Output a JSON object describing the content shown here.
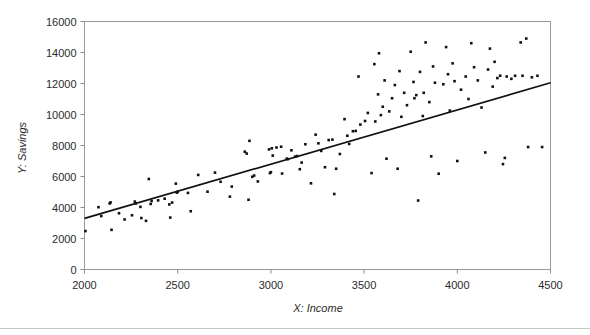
{
  "chart_data": {
    "type": "scatter",
    "title": "",
    "xlabel": "X: Income",
    "ylabel": "Y: Savings",
    "xlim": [
      2000,
      4500
    ],
    "ylim": [
      0,
      16000
    ],
    "xticks": [
      2000,
      2500,
      3000,
      3500,
      4000,
      4500
    ],
    "yticks": [
      0,
      2000,
      4000,
      6000,
      8000,
      10000,
      12000,
      14000,
      16000
    ],
    "xtick_labels": [
      "2000",
      "2500",
      "3000",
      "3500",
      "4000",
      "4500"
    ],
    "ytick_labels": [
      "0",
      "2000",
      "4000",
      "6000",
      "8000",
      "10000",
      "12000",
      "14000",
      "16000"
    ],
    "grid": false,
    "legend": null,
    "marker": "square",
    "marker_color": "#111111",
    "trendline": {
      "type": "linear",
      "x": [
        2000,
        4500
      ],
      "y": [
        3300,
        12050
      ],
      "slope": 3.5,
      "intercept": -3700,
      "color": "#111111"
    },
    "series": [
      {
        "name": "Savings vs Income",
        "points": [
          [
            2005,
            2480
          ],
          [
            2075,
            4020
          ],
          [
            2090,
            3450
          ],
          [
            2135,
            4260
          ],
          [
            2140,
            4330
          ],
          [
            2145,
            2560
          ],
          [
            2185,
            3630
          ],
          [
            2215,
            3230
          ],
          [
            2255,
            3500
          ],
          [
            2270,
            4380
          ],
          [
            2275,
            4260
          ],
          [
            2300,
            4040
          ],
          [
            2305,
            3320
          ],
          [
            2330,
            3140
          ],
          [
            2345,
            5840
          ],
          [
            2355,
            4230
          ],
          [
            2360,
            4420
          ],
          [
            2395,
            4460
          ],
          [
            2430,
            4570
          ],
          [
            2455,
            4200
          ],
          [
            2460,
            3350
          ],
          [
            2470,
            4320
          ],
          [
            2490,
            5540
          ],
          [
            2495,
            4960
          ],
          [
            2500,
            5010
          ],
          [
            2555,
            4940
          ],
          [
            2570,
            3760
          ],
          [
            2610,
            6100
          ],
          [
            2660,
            5020
          ],
          [
            2700,
            6250
          ],
          [
            2730,
            5660
          ],
          [
            2780,
            4700
          ],
          [
            2790,
            5350
          ],
          [
            2860,
            7600
          ],
          [
            2870,
            7480
          ],
          [
            2880,
            4500
          ],
          [
            2885,
            8300
          ],
          [
            2900,
            5980
          ],
          [
            2910,
            6060
          ],
          [
            2930,
            5680
          ],
          [
            2990,
            7750
          ],
          [
            2995,
            6220
          ],
          [
            3000,
            6280
          ],
          [
            3005,
            7820
          ],
          [
            3010,
            7350
          ],
          [
            3030,
            7870
          ],
          [
            3055,
            7920
          ],
          [
            3060,
            6190
          ],
          [
            3085,
            7150
          ],
          [
            3090,
            7120
          ],
          [
            3110,
            7690
          ],
          [
            3130,
            7280
          ],
          [
            3140,
            7320
          ],
          [
            3155,
            6470
          ],
          [
            3165,
            6900
          ],
          [
            3185,
            8080
          ],
          [
            3215,
            5560
          ],
          [
            3240,
            8700
          ],
          [
            3255,
            8140
          ],
          [
            3270,
            7650
          ],
          [
            3290,
            6600
          ],
          [
            3310,
            8350
          ],
          [
            3330,
            8380
          ],
          [
            3340,
            4870
          ],
          [
            3350,
            6500
          ],
          [
            3370,
            7450
          ],
          [
            3395,
            9700
          ],
          [
            3410,
            8630
          ],
          [
            3420,
            8100
          ],
          [
            3440,
            8920
          ],
          [
            3455,
            8940
          ],
          [
            3470,
            12450
          ],
          [
            3480,
            9350
          ],
          [
            3505,
            9580
          ],
          [
            3520,
            10100
          ],
          [
            3540,
            6220
          ],
          [
            3555,
            13250
          ],
          [
            3560,
            9550
          ],
          [
            3575,
            11300
          ],
          [
            3580,
            13950
          ],
          [
            3590,
            9960
          ],
          [
            3600,
            10500
          ],
          [
            3610,
            12200
          ],
          [
            3620,
            7150
          ],
          [
            3635,
            10200
          ],
          [
            3650,
            11050
          ],
          [
            3665,
            11900
          ],
          [
            3680,
            6500
          ],
          [
            3690,
            12800
          ],
          [
            3700,
            9850
          ],
          [
            3715,
            11400
          ],
          [
            3730,
            10600
          ],
          [
            3750,
            14050
          ],
          [
            3765,
            12100
          ],
          [
            3770,
            11050
          ],
          [
            3780,
            11250
          ],
          [
            3790,
            4450
          ],
          [
            3800,
            12750
          ],
          [
            3815,
            9900
          ],
          [
            3820,
            11400
          ],
          [
            3830,
            14650
          ],
          [
            3850,
            10800
          ],
          [
            3860,
            7300
          ],
          [
            3870,
            13100
          ],
          [
            3880,
            12050
          ],
          [
            3900,
            6180
          ],
          [
            3925,
            11950
          ],
          [
            3940,
            14350
          ],
          [
            3950,
            12600
          ],
          [
            3960,
            10250
          ],
          [
            3975,
            13300
          ],
          [
            3985,
            12150
          ],
          [
            4000,
            7000
          ],
          [
            4020,
            11600
          ],
          [
            4045,
            12450
          ],
          [
            4060,
            11000
          ],
          [
            4075,
            14600
          ],
          [
            4090,
            13050
          ],
          [
            4110,
            12200
          ],
          [
            4130,
            10450
          ],
          [
            4150,
            7550
          ],
          [
            4165,
            12900
          ],
          [
            4175,
            14250
          ],
          [
            4190,
            11800
          ],
          [
            4200,
            13400
          ],
          [
            4215,
            12350
          ],
          [
            4230,
            12500
          ],
          [
            4245,
            6800
          ],
          [
            4255,
            7200
          ],
          [
            4265,
            12450
          ],
          [
            4290,
            12300
          ],
          [
            4310,
            12500
          ],
          [
            4340,
            14650
          ],
          [
            4350,
            12500
          ],
          [
            4370,
            14900
          ],
          [
            4380,
            7900
          ],
          [
            4400,
            12400
          ],
          [
            4430,
            12500
          ],
          [
            4455,
            7900
          ]
        ]
      }
    ]
  },
  "axes": {
    "y_title": "Y: Savings",
    "x_title": "X: Income"
  }
}
